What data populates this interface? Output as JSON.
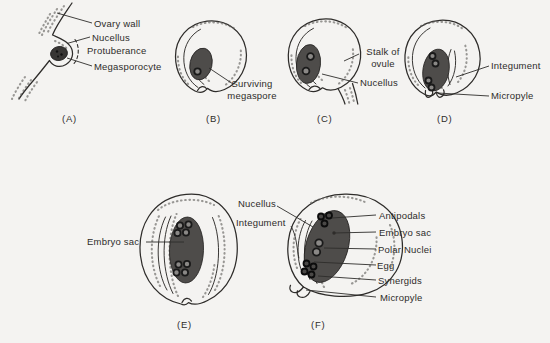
{
  "colors": {
    "paper": "#f4f3f1",
    "ink": "#2e2c2a",
    "sac": "#4e4c4a",
    "sac_dark": "#383634",
    "nucleus_ring": "#1a1a1a",
    "nucleus_center": "#8a8886",
    "stipple": "#5f5d5b"
  },
  "stages": {
    "A": {
      "letter": "(A)",
      "labels": {
        "ovary_wall": "Ovary wall",
        "nucellus": "Nucellus",
        "protuberance": "Protuberance",
        "megasporocyte": "Megasporocyte"
      }
    },
    "B": {
      "letter": "(B)",
      "labels": {
        "surviving_megaspore": "Surviving\nmegaspore"
      }
    },
    "C": {
      "letter": "(C)",
      "labels": {
        "stalk_of_ovule": "Stalk of\novule",
        "nucellus": "Nucellus"
      }
    },
    "D": {
      "letter": "(D)",
      "labels": {
        "integument": "Integument",
        "micropyle": "Micropyle"
      }
    },
    "E": {
      "letter": "(E)",
      "labels": {
        "embryo_sac": "Embryo sac"
      }
    },
    "F": {
      "letter": "(F)",
      "labels": {
        "nucellus": "Nucellus",
        "integument": "Integument",
        "antipodals": "Antipodals",
        "embryo_sac": "Embryo sac",
        "polar_nuclei": "Polar Nuclei",
        "egg": "Egg",
        "synergids": "Synergids",
        "micropyle": "Micropyle"
      }
    }
  }
}
